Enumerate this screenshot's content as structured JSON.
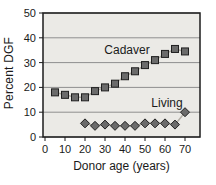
{
  "chart_data": {
    "type": "line",
    "xlabel": "Donor age (years)",
    "ylabel": "Percent DGF",
    "xlim": [
      0,
      75
    ],
    "ylim": [
      0,
      50
    ],
    "xticks": [
      0,
      10,
      20,
      30,
      40,
      50,
      60,
      70
    ],
    "yticks": [
      0,
      10,
      20,
      30,
      40,
      50
    ],
    "grid": "horizontal",
    "legend_position": "inline-labels",
    "plot_background": "#ebeae6",
    "colors": {
      "marker_fill": "#6b6b6b",
      "marker_stroke": "#1f1f1f",
      "line": "#b3afa7",
      "grid": "#8f8f8f",
      "border": "#1c1c1c",
      "text": "#1a1a1a"
    },
    "series": [
      {
        "name": "Cadaver",
        "marker": "square",
        "x": [
          5,
          10,
          15,
          20,
          25,
          30,
          35,
          40,
          45,
          50,
          55,
          60,
          65,
          70
        ],
        "values": [
          18,
          17,
          16,
          16,
          18.5,
          20,
          21.5,
          24.5,
          26.5,
          29,
          31,
          33.5,
          35.5,
          34.5
        ],
        "label": {
          "text": "Cadaver",
          "x": 41,
          "y": 33.5
        }
      },
      {
        "name": "Living",
        "marker": "diamond",
        "x": [
          20,
          25,
          30,
          35,
          40,
          45,
          50,
          55,
          60,
          65,
          70
        ],
        "values": [
          5.5,
          4.5,
          5,
          4.5,
          4.5,
          4.5,
          5.5,
          5.5,
          5.5,
          5,
          10
        ],
        "label": {
          "text": "Living",
          "x": 61,
          "y": 12
        }
      }
    ]
  }
}
